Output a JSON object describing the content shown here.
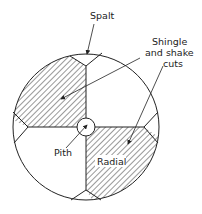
{
  "diagram": {
    "labels": {
      "spalt": "Spalt",
      "shingle_line1": "Shingle",
      "shingle_line2": "and shake",
      "shingle_line3": "cuts",
      "pith": "Pith",
      "radial": "Radial"
    },
    "colors": {
      "line": "#222222",
      "hatch": "#333333",
      "background": "#ffffff"
    }
  }
}
